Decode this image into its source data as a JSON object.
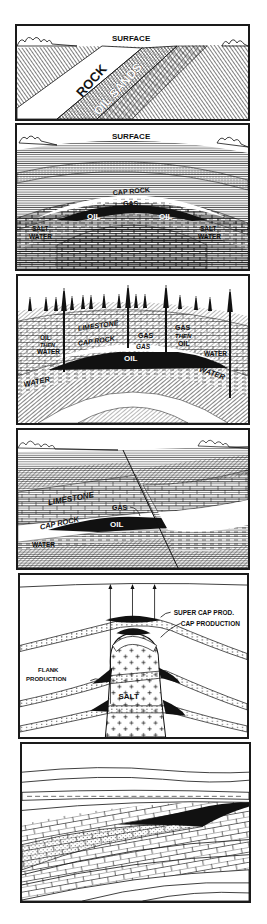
{
  "figure": {
    "type": "geology-diagram-series",
    "panels": [
      {
        "id": "outcrop",
        "labels": {
          "surface": "SURFACE",
          "rock": "ROCK",
          "oil_sands": "OIL SANDS"
        }
      },
      {
        "id": "anticline",
        "labels": {
          "surface": "SURFACE",
          "cap_rock": "CAP ROCK",
          "gas": "GAS",
          "oil_left": "OIL",
          "oil_right": "OIL",
          "salt_water_left_1": "SALT",
          "salt_water_left_2": "WATER",
          "salt_water_right_1": "SALT",
          "salt_water_right_2": "WATER"
        }
      },
      {
        "id": "anticline-wells",
        "labels": {
          "limestone": "LIMESTONE",
          "cap_rock": "CAP ROCK",
          "oil_then_water_1": "OIL",
          "oil_then_water_2": "THEN",
          "oil_then_water_3": "WATER",
          "gas_upper": "GAS",
          "gas_lower": "GAS",
          "gas_then_oil_1": "GAS",
          "gas_then_oil_2": "THEN",
          "gas_then_oil_3": "OIL",
          "water_well": "WATER",
          "oil": "OIL",
          "water_left": "WATER",
          "water_right": "WATER"
        },
        "derrick_count": 17,
        "well_count": 4
      },
      {
        "id": "fault-trap",
        "labels": {
          "limestone": "LIMESTONE",
          "gas": "GAS",
          "cap_rock": "CAP ROCK",
          "oil": "OIL",
          "water": "WATER"
        }
      },
      {
        "id": "salt-dome",
        "labels": {
          "super_cap": "SUPER CAP PROD.",
          "cap_production": "CAP PRODUCTION",
          "flank_1": "FLANK",
          "flank_2": "PRODUCTION",
          "salt": "SALT"
        },
        "well_count": 3
      },
      {
        "id": "stratigraphic-trap",
        "labels": {}
      }
    ]
  },
  "colors": {
    "ink": "#111111",
    "paper": "#ffffff",
    "border": "#1a1a1a"
  }
}
